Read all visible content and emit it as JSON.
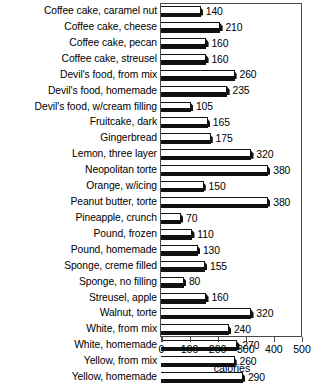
{
  "chart_data": {
    "type": "bar",
    "orientation": "horizontal",
    "title": "",
    "subtitle": "",
    "xlabel": "calories",
    "ylabel": "",
    "xlim": [
      0,
      500
    ],
    "xticks": [
      0,
      100,
      200,
      300,
      400,
      500
    ],
    "xtick_labels": [
      "0",
      "100",
      "200",
      "300",
      "400",
      "500"
    ],
    "grid": false,
    "legend": false,
    "data_labels": true,
    "categories": [
      "Coffee cake, caramel nut",
      "Coffee cake, cheese",
      "Coffee cake, pecan",
      "Coffee cake, streusel",
      "Devil's food, from mix",
      "Devil's food, homemade",
      "Devil's food, w/cream filling",
      "Fruitcake, dark",
      "Gingerbread",
      "Lemon, three layer",
      "Neopolitan torte",
      "Orange, w/icing",
      "Peanut butter, torte",
      "Pineapple, crunch",
      "Pound, frozen",
      "Pound, homemade",
      "Sponge, creme filled",
      "Sponge, no filling",
      "Streusel, apple",
      "Walnut, torte",
      "White, from mix",
      "White, homemade",
      "Yellow, from mix",
      "Yellow, homemade"
    ],
    "values": [
      140,
      210,
      160,
      160,
      260,
      235,
      105,
      165,
      175,
      320,
      380,
      150,
      380,
      70,
      110,
      130,
      155,
      80,
      160,
      320,
      240,
      270,
      260,
      290
    ],
    "value_labels": [
      "140",
      "210",
      "160",
      "160",
      "260",
      "235",
      "105",
      "165",
      "175",
      "320",
      "380",
      "150",
      "380",
      "70",
      "110",
      "130",
      "155",
      "80",
      "160",
      "320",
      "240",
      "270",
      "260",
      "290"
    ],
    "series": [
      {
        "name": "calories",
        "values": [
          140,
          210,
          160,
          160,
          260,
          235,
          105,
          165,
          175,
          320,
          380,
          150,
          380,
          70,
          110,
          130,
          155,
          80,
          160,
          320,
          240,
          270,
          260,
          290
        ]
      }
    ],
    "colors": {
      "bar_face": "#ffffff",
      "bar_outline": "#111111",
      "bar_shadow": "#111111",
      "frame": "#4a4a4a",
      "text": "#000000",
      "background": "#ffffff"
    }
  }
}
